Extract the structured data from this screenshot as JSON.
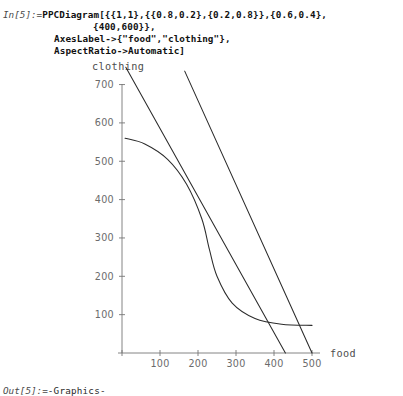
{
  "notebook": {
    "input_prompt": "In[5]:=",
    "output_prompt": "Out[5]:=",
    "output_value": "-Graphics-",
    "code_lines": [
      "PPCDiagram[{{1,1},{{0.8,0.2},{0.2,0.8}},{0.6,0.4},",
      "{400,600}},",
      "AxesLabel->{\"food\",\"clothing\"},",
      "AspectRatio->Automatic]"
    ],
    "code_line_1_head": "PPCDiagram[{{1,1},{{0.8,0.2},{0.2,0.8}},{0.6,0.4},",
    "code_line_2": "{400,600}},",
    "code_line_3": "AxesLabel->{\"food\",\"clothing\"},",
    "code_line_4": "AspectRatio->Automatic]"
  },
  "chart_data": {
    "type": "line",
    "title": "",
    "xlabel": "food",
    "ylabel": "clothing",
    "xlim": [
      0,
      530
    ],
    "ylim": [
      0,
      760
    ],
    "grid": false,
    "legend": "none",
    "x_ticks": [
      100,
      200,
      300,
      400,
      500
    ],
    "y_ticks": [
      100,
      200,
      300,
      400,
      500,
      600,
      700
    ],
    "x_tick_labels": [
      "100",
      "200",
      "300",
      "400",
      "500"
    ],
    "y_tick_labels": [
      "100",
      "200",
      "300",
      "400",
      "500",
      "600",
      "700"
    ],
    "tangency_point": [
      230,
      270
    ],
    "series": [
      {
        "name": "budget-line-steep",
        "kind": "straight",
        "points": [
          [
            10,
            745
          ],
          [
            430,
            0
          ]
        ]
      },
      {
        "name": "budget-line-shallow",
        "kind": "straight",
        "points": [
          [
            165,
            735
          ],
          [
            500,
            0
          ]
        ]
      },
      {
        "name": "production-possibility-frontier",
        "kind": "concave-curve",
        "points": [
          [
            8,
            560
          ],
          [
            60,
            545
          ],
          [
            120,
            505
          ],
          [
            170,
            440
          ],
          [
            210,
            350
          ],
          [
            230,
            270
          ],
          [
            250,
            200
          ],
          [
            290,
            130
          ],
          [
            350,
            90
          ],
          [
            420,
            75
          ],
          [
            500,
            72
          ]
        ]
      }
    ]
  },
  "axes": {
    "x_label": "food",
    "y_label": "clothing"
  }
}
